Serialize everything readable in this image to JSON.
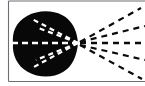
{
  "figure": {
    "canvas": {
      "width": 145,
      "height": 86,
      "background_color": "#ffffff"
    },
    "colors": {
      "lobe_fill": "#080808",
      "ray_light": "#ffffff",
      "ray_dark": "#0b0b0b",
      "axis_frame": "#6b6f73"
    },
    "frame": {
      "left_rule": {
        "x": 8.5,
        "y1": 1,
        "y2": 81.5
      },
      "bottom_rule": {
        "y": 81.5,
        "x1": 8.5,
        "x2": 145
      },
      "top_rule": {
        "y": 1.0,
        "x1": 8.5,
        "x2": 145
      }
    },
    "focal_point": {
      "x": 78,
      "y": 43
    },
    "lobe": {
      "shape": "teardrop",
      "left_extent": 13,
      "right_apex": 78,
      "top_extent": 13,
      "bottom_extent": 77,
      "path": "M 78 43 C 77 30 72 20 62 15 C 52 10 38 10 27 16 C 16 22 12 32 13 43 C 12 55 17 66 28 72 C 39 78 53 78 63 72 C 72 67 77 56 78 43 Z"
    },
    "rays": [
      {
        "name": "ray-upper-outer-inside",
        "segment": "inside-lobe",
        "from": {
          "x": 78,
          "y": 43
        },
        "to": {
          "x": 32,
          "y": 19
        },
        "dash": "5,4",
        "color": "light"
      },
      {
        "name": "ray-upper-mid-inside",
        "segment": "inside-lobe",
        "from": {
          "x": 78,
          "y": 43
        },
        "to": {
          "x": 36,
          "y": 27
        },
        "dash": "5,4",
        "color": "light"
      },
      {
        "name": "ray-axis-inside",
        "segment": "inside-lobe",
        "from": {
          "x": 78,
          "y": 43
        },
        "to": {
          "x": 9,
          "y": 43
        },
        "dash": "6,4",
        "color": "light"
      },
      {
        "name": "ray-lower-mid-inside",
        "segment": "inside-lobe",
        "from": {
          "x": 78,
          "y": 43
        },
        "to": {
          "x": 36,
          "y": 60
        },
        "dash": "5,4",
        "color": "light"
      },
      {
        "name": "ray-lower-outer-inside",
        "segment": "inside-lobe",
        "from": {
          "x": 78,
          "y": 43
        },
        "to": {
          "x": 32,
          "y": 68
        },
        "dash": "5,4",
        "color": "light"
      },
      {
        "name": "ray-upper-outside",
        "segment": "outside-lobe",
        "from": {
          "x": 80,
          "y": 42
        },
        "to": {
          "x": 141,
          "y": 8
        },
        "dash": "6,5",
        "color": "dark"
      },
      {
        "name": "ray-upper-inner-outside",
        "segment": "outside-lobe",
        "from": {
          "x": 80,
          "y": 42
        },
        "to": {
          "x": 145,
          "y": 26
        },
        "dash": "6,5",
        "color": "dark"
      },
      {
        "name": "ray-axis-outside",
        "segment": "outside-lobe",
        "from": {
          "x": 80,
          "y": 43
        },
        "to": {
          "x": 145,
          "y": 43
        },
        "dash": "6,5",
        "color": "dark"
      },
      {
        "name": "ray-lower-inner-outside",
        "segment": "outside-lobe",
        "from": {
          "x": 80,
          "y": 45
        },
        "to": {
          "x": 145,
          "y": 60
        },
        "dash": "6,5",
        "color": "dark"
      },
      {
        "name": "ray-lower-outside",
        "segment": "outside-lobe",
        "from": {
          "x": 80,
          "y": 45
        },
        "to": {
          "x": 142,
          "y": 79
        },
        "dash": "6,5",
        "color": "dark"
      }
    ]
  }
}
